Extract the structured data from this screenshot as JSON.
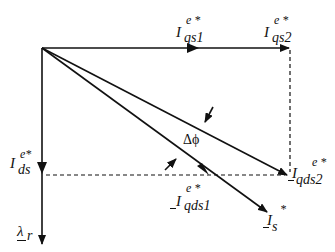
{
  "diagram": {
    "type": "phasor-vector-diagram",
    "labels": {
      "iqs1": {
        "main": "I",
        "sup": "e *",
        "sub": "qs1"
      },
      "iqs2": {
        "main": "I",
        "sup": "e *",
        "sub": "qs2"
      },
      "ids": {
        "main": "I",
        "sup": "e*",
        "sub": "ds"
      },
      "iqds1": {
        "main": "I",
        "sup": "e *",
        "sub": "qds1"
      },
      "iqds2": {
        "main": "I",
        "sup": "e *",
        "sub": "qds2"
      },
      "is": {
        "main": "I",
        "sup": "*",
        "sub": "s"
      },
      "lambda_r": {
        "main": "λ",
        "sub": "r"
      },
      "delta_phi": "Δϕ"
    },
    "colors": {
      "line": "#111111",
      "background": "#ffffff"
    }
  }
}
